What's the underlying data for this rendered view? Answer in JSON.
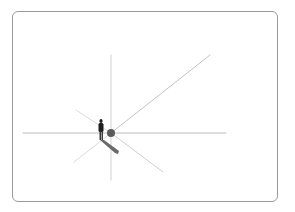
{
  "scene": {
    "description": "Minimal photograph of a lone person standing beside a dark circular marker from which light grey lines radiate outward, inside a rounded rectangular frame",
    "colors": {
      "background": "#ffffff",
      "frame": "#9a9a9a",
      "rays": "#c8c8c8",
      "marker": "#5a5a5a",
      "figure": "#1e1e1e",
      "shadow": "#555555"
    },
    "center": {
      "x": 111,
      "y": 133
    },
    "rays": [
      {
        "name": "horizontal",
        "x1": 23,
        "y1": 133,
        "x2": 226,
        "y2": 133
      },
      {
        "name": "vertical",
        "x1": 111,
        "y1": 55,
        "x2": 111,
        "y2": 180
      },
      {
        "name": "up-right",
        "x1": 111,
        "y1": 133,
        "x2": 210,
        "y2": 55
      },
      {
        "name": "down-right",
        "x1": 111,
        "y1": 133,
        "x2": 163,
        "y2": 172
      },
      {
        "name": "up-left",
        "x1": 111,
        "y1": 133,
        "x2": 76,
        "y2": 110
      },
      {
        "name": "down-left",
        "x1": 111,
        "y1": 133,
        "x2": 74,
        "y2": 162
      }
    ]
  }
}
